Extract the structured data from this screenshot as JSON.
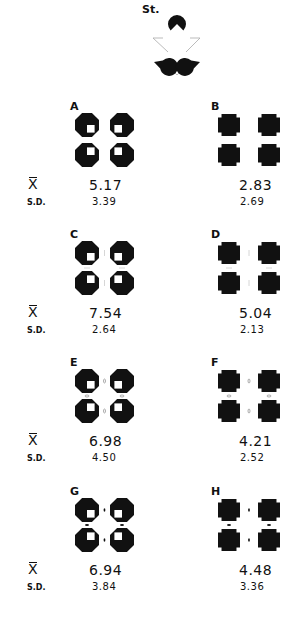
{
  "figure": {
    "standard": {
      "label": "St.",
      "description": "Kanizsa illusory triangle: three black pacman inducers with gray outline triangle"
    },
    "stat_labels": {
      "mean": "X",
      "sd": "S.D."
    },
    "conditions": [
      {
        "id": "A",
        "label": "A",
        "inducer": "octagon-notched",
        "gap_marks": "none",
        "mean": "5.17",
        "sd": "3.39"
      },
      {
        "id": "B",
        "label": "B",
        "inducer": "cross",
        "gap_marks": "none",
        "mean": "2.83",
        "sd": "2.69"
      },
      {
        "id": "C",
        "label": "C",
        "inducer": "octagon-notched",
        "gap_marks": "faint-lines",
        "mean": "7.54",
        "sd": "2.64"
      },
      {
        "id": "D",
        "label": "D",
        "inducer": "cross",
        "gap_marks": "faint-lines",
        "mean": "5.04",
        "sd": "2.13"
      },
      {
        "id": "E",
        "label": "E",
        "inducer": "octagon-notched",
        "gap_marks": "small-circles",
        "mean": "6.98",
        "sd": "4.50"
      },
      {
        "id": "F",
        "label": "F",
        "inducer": "cross",
        "gap_marks": "small-circles",
        "mean": "4.21",
        "sd": "2.52"
      },
      {
        "id": "G",
        "label": "G",
        "inducer": "octagon-notched",
        "gap_marks": "black-dots",
        "mean": "6.94",
        "sd": "3.84"
      },
      {
        "id": "H",
        "label": "H",
        "inducer": "cross",
        "gap_marks": "black-dots",
        "mean": "4.48",
        "sd": "3.36"
      }
    ]
  },
  "chart_data": {
    "type": "table",
    "title": "",
    "columns": [
      "Condition",
      "Mean (X̄)",
      "S.D."
    ],
    "rows": [
      [
        "St.",
        "",
        ""
      ],
      [
        "A",
        5.17,
        3.39
      ],
      [
        "B",
        2.83,
        2.69
      ],
      [
        "C",
        7.54,
        2.64
      ],
      [
        "D",
        5.04,
        2.13
      ],
      [
        "E",
        6.98,
        4.5
      ],
      [
        "F",
        4.21,
        2.52
      ],
      [
        "G",
        6.94,
        3.84
      ],
      [
        "H",
        4.48,
        3.36
      ]
    ]
  },
  "colors": {
    "ink": "#111111",
    "outline": "#aaaaaa",
    "background": "#ffffff"
  }
}
